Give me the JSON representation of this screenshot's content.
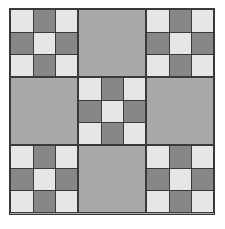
{
  "quilt": {
    "grid_size": 3,
    "block_layout": [
      [
        "nine-patch",
        "solid",
        "nine-patch"
      ],
      [
        "solid",
        "nine-patch",
        "solid"
      ],
      [
        "nine-patch",
        "solid",
        "nine-patch"
      ]
    ],
    "nine_patch_pattern": [
      [
        "light",
        "dark",
        "light"
      ],
      [
        "dark",
        "light",
        "dark"
      ],
      [
        "light",
        "dark",
        "light"
      ]
    ],
    "colors": {
      "light": "#e6e6e6",
      "dark": "#878787",
      "solid": "#a9a9a9",
      "outline": "#3a3a3a"
    }
  }
}
